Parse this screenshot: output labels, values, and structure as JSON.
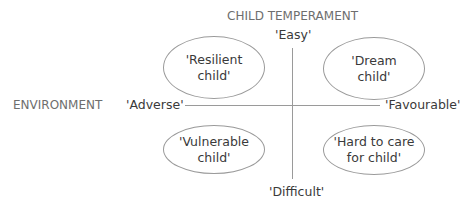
{
  "diagram": {
    "vertical_axis": {
      "title": "CHILD TEMPERAMENT",
      "top_pole": "'Easy'",
      "bottom_pole": "'Difficult'"
    },
    "horizontal_axis": {
      "title": "ENVIRONMENT",
      "left_pole": "'Adverse'",
      "right_pole": "'Favourable'"
    },
    "quadrants": [
      {
        "position": "top-left",
        "line1": "'Resilient",
        "line2": "child'"
      },
      {
        "position": "top-right",
        "line1": "'Dream",
        "line2": "child'"
      },
      {
        "position": "bottom-left",
        "line1": "'Vulnerable",
        "line2": "child'"
      },
      {
        "position": "bottom-right",
        "line1": "'Hard to care",
        "line2": "for child'"
      }
    ],
    "colors": {
      "line": "#9a9a9a",
      "axis_title": "#6e6e6e",
      "text": "#3a3a3a"
    }
  }
}
